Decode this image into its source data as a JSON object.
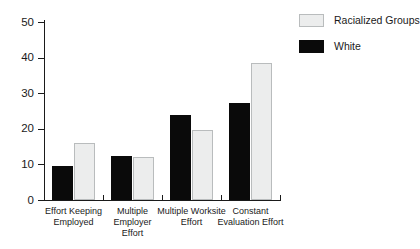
{
  "chart_data": {
    "type": "bar",
    "title": "",
    "xlabel": "",
    "ylabel": "",
    "ylim": [
      0,
      50
    ],
    "yticks": [
      0,
      10,
      20,
      30,
      40,
      50
    ],
    "ytick_labels": [
      "0",
      "10",
      "20",
      "30",
      "40",
      "50"
    ],
    "grid": false,
    "legend_position": "top-right",
    "categories": [
      "Effort Keeping Employed",
      "Multiple Employer Effort",
      "Multiple Worksite Effort",
      "Constant Evaluation Effort"
    ],
    "category_lines": [
      [
        "Effort Keeping",
        "Employed"
      ],
      [
        "Multiple Employer",
        "Effort"
      ],
      [
        "Multiple Worksite",
        "Effort"
      ],
      [
        "Constant",
        "Evaluation Effort"
      ]
    ],
    "series": [
      {
        "name": "White",
        "color": "#0a0a0a",
        "values": [
          9.5,
          12.3,
          24.0,
          27.2
        ]
      },
      {
        "name": "Racialized Groups",
        "color": "#eceded",
        "values": [
          16.0,
          12.1,
          19.7,
          38.5
        ]
      }
    ]
  },
  "legend": {
    "items": [
      {
        "label": "Racialized Groups",
        "series": "racialized"
      },
      {
        "label": "White",
        "series": "white"
      }
    ]
  }
}
